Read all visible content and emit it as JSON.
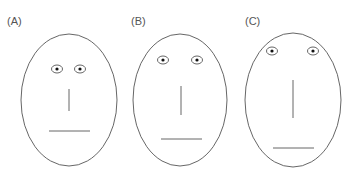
{
  "faces": [
    {
      "label": "(A)",
      "lx": 7,
      "ly": 25,
      "cx": 69,
      "cy": 100,
      "rx": 48,
      "ry": 66,
      "eyes": [
        {
          "x": 57,
          "y": 69
        },
        {
          "x": 80,
          "y": 69
        }
      ],
      "nose": {
        "x": 69,
        "y1": 89,
        "y2": 111
      },
      "mouth": {
        "y": 131,
        "x1": 49,
        "x2": 90
      }
    },
    {
      "label": "(B)",
      "lx": 131,
      "ly": 25,
      "cx": 180,
      "cy": 100,
      "rx": 47,
      "ry": 66,
      "eyes": [
        {
          "x": 163,
          "y": 60
        },
        {
          "x": 197,
          "y": 60
        }
      ],
      "nose": {
        "x": 181,
        "y1": 86,
        "y2": 115
      },
      "mouth": {
        "y": 139,
        "x1": 161,
        "x2": 202
      }
    },
    {
      "label": "(C)",
      "lx": 245,
      "ly": 25,
      "cx": 293,
      "cy": 100,
      "rx": 48,
      "ry": 67,
      "eyes": [
        {
          "x": 272,
          "y": 51
        },
        {
          "x": 313,
          "y": 51
        }
      ],
      "nose": {
        "x": 293,
        "y1": 80,
        "y2": 118
      },
      "mouth": {
        "y": 148,
        "x1": 273,
        "x2": 314
      }
    }
  ],
  "colors": {
    "stroke": "#555555",
    "pupil": "#111111"
  }
}
